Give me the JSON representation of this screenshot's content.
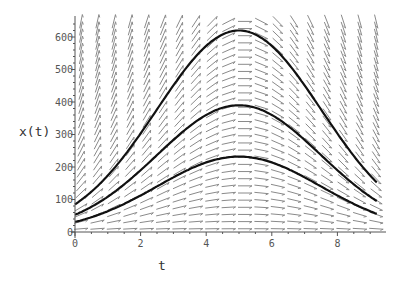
{
  "chart_data": {
    "type": "line",
    "title": "",
    "xlabel": "t",
    "ylabel": "x(t)",
    "xlim": [
      0,
      9.4
    ],
    "ylim": [
      0,
      660
    ],
    "x_ticks": [
      "0",
      "2",
      "4",
      "6",
      "8"
    ],
    "y_ticks": [
      "0",
      "100",
      "200",
      "300",
      "400",
      "500",
      "600"
    ],
    "grid": false,
    "legend": null,
    "direction_field": {
      "equation": "dx/dt = a*(5 - t)*x",
      "a": 0.16,
      "arrow_color": "#888888"
    },
    "series": [
      {
        "name": "x(0)=85",
        "x": [
          0,
          1,
          2,
          3,
          4,
          5,
          6,
          7,
          8,
          9
        ],
        "values": [
          85,
          158,
          252,
          350,
          588,
          620,
          530,
          245,
          40,
          2
        ]
      },
      {
        "name": "x(0)=53",
        "x": [
          0,
          1,
          2,
          3,
          4,
          5,
          6,
          7,
          8,
          9
        ],
        "values": [
          53,
          100,
          160,
          250,
          350,
          390,
          335,
          155,
          25,
          1
        ]
      },
      {
        "name": "x(0)=31",
        "x": [
          0,
          1,
          2,
          3,
          4,
          5,
          6,
          7,
          8,
          9
        ],
        "values": [
          31,
          58,
          95,
          150,
          210,
          232,
          200,
          92,
          15,
          1
        ]
      }
    ],
    "colors": {
      "curve": "#111111",
      "axis": "#555555",
      "arrow": "#8a8a8a"
    }
  },
  "labels": {
    "x_axis": "t",
    "y_axis": "x(t)"
  }
}
